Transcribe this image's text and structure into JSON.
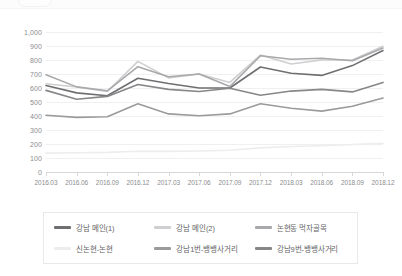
{
  "chart_data": {
    "type": "line",
    "title": "",
    "xlabel": "",
    "ylabel": "",
    "ylim": [
      0,
      1000
    ],
    "ytick_step": 100,
    "grid": true,
    "legend_position": "bottom",
    "ytick_labels": [
      "1,000",
      "900",
      "800",
      "700",
      "600",
      "500",
      "400",
      "300",
      "200",
      "100",
      "0"
    ],
    "categories": [
      "2016.03",
      "2016.06",
      "2016.09",
      "2016.12",
      "2017.03",
      "2017.06",
      "2017.09",
      "2017.12",
      "2018.03",
      "2018.06",
      "2018.09",
      "2018.12"
    ],
    "series": [
      {
        "name": "강남 메인(1)",
        "color": "#6f6f72",
        "values": [
          618,
          565,
          545,
          670,
          632,
          600,
          600,
          750,
          705,
          690,
          760,
          868
        ]
      },
      {
        "name": "강남 메인(2)",
        "color": "#cfcfd1",
        "values": [
          630,
          607,
          575,
          790,
          672,
          700,
          640,
          835,
          772,
          800,
          800,
          898
        ]
      },
      {
        "name": "논현동 먹자골목",
        "color": "#a9a9ac",
        "values": [
          695,
          608,
          580,
          752,
          680,
          700,
          610,
          830,
          805,
          812,
          795,
          885
        ]
      },
      {
        "name": "신논현-논현",
        "color": "#ededee",
        "values": [
          135,
          137,
          140,
          148,
          147,
          150,
          155,
          172,
          182,
          188,
          196,
          205
        ]
      },
      {
        "name": "강남1번-뱅뱅사거리",
        "color": "#9b9b9e",
        "values": [
          405,
          390,
          395,
          487,
          415,
          402,
          415,
          487,
          455,
          435,
          470,
          528
        ]
      },
      {
        "name": "강남9번-뱅뱅사거리",
        "color": "#87878a",
        "values": [
          583,
          520,
          540,
          625,
          590,
          575,
          598,
          548,
          578,
          590,
          572,
          640
        ]
      }
    ]
  },
  "legend": {
    "items": [
      {
        "label": "강남 메인(1)",
        "color": "#6f6f72"
      },
      {
        "label": "강남 메인(2)",
        "color": "#cfcfd1"
      },
      {
        "label": "논현동 먹자골목",
        "color": "#a9a9ac"
      },
      {
        "label": "신논현-논현",
        "color": "#ededee"
      },
      {
        "label": "강남1번-뱅뱅사거리",
        "color": "#9b9b9e"
      },
      {
        "label": "강남9번-뱅뱅사거리",
        "color": "#87878a"
      }
    ]
  }
}
